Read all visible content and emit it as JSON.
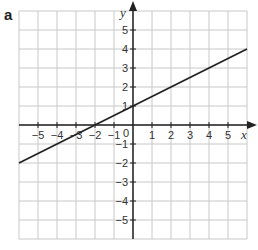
{
  "panel": {
    "label": "a"
  },
  "colors": {
    "grid": "#c8c8c8",
    "axis": "#222222",
    "line": "#222222",
    "text": "#333333"
  },
  "chart_data": {
    "type": "line",
    "title": "",
    "xlabel": "x",
    "ylabel": "y",
    "xlim": [
      -6,
      6
    ],
    "ylim": [
      -6,
      6
    ],
    "grid": true,
    "x_ticks": [
      -5,
      -4,
      -3,
      -2,
      -1,
      1,
      2,
      3,
      4,
      5
    ],
    "y_ticks": [
      -5,
      -4,
      -3,
      -2,
      -1,
      1,
      2,
      3,
      4,
      5
    ],
    "origin_label": "0",
    "series": [
      {
        "name": "y = 0.5x + 1",
        "x": [
          -6,
          -4,
          -2,
          0,
          2,
          4,
          6
        ],
        "y": [
          -2,
          -1,
          0,
          1,
          2,
          3,
          4
        ]
      }
    ]
  }
}
